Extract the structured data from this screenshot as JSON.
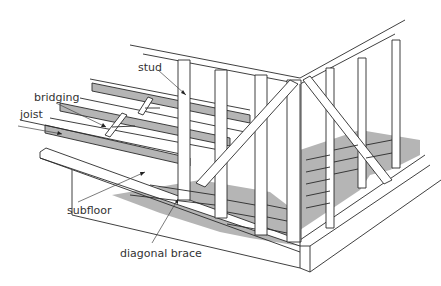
{
  "diagram": {
    "labels": {
      "stud": "stud",
      "bridging": "bridging",
      "joist": "joist",
      "subfloor": "subfloor",
      "diagonal_brace": "diagonal brace"
    },
    "colors": {
      "line": "#2a2a2a",
      "shade": "#b5b5b5",
      "background": "#ffffff",
      "text": "#333333"
    }
  }
}
